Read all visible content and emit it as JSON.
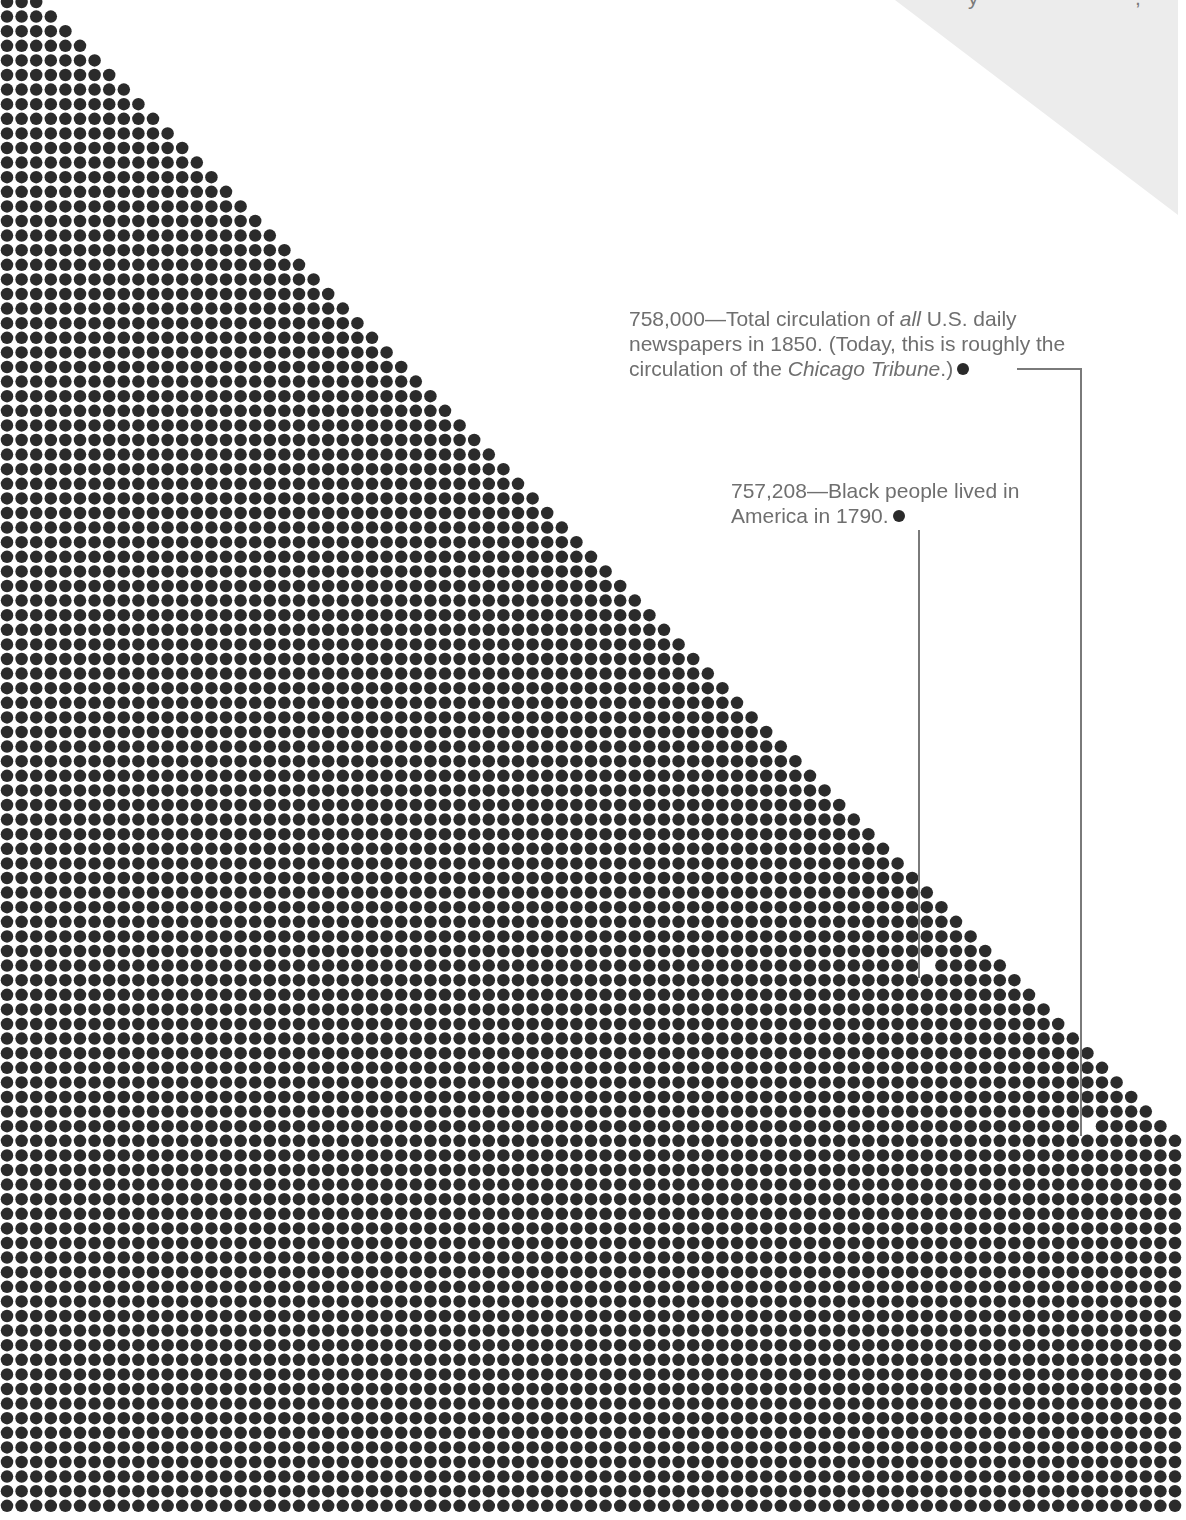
{
  "chart_data": {
    "type": "dot-matrix",
    "title": "",
    "layout": {
      "dot_pitch_px": 14.6,
      "dot_diameter_px": 12.5,
      "first_row_dots": 3,
      "dots_added_per_row": 1,
      "max_columns": 81,
      "rows_visible": 104,
      "dot_color": "#2b2b2b",
      "background": "#ffffff"
    },
    "annotations": [
      {
        "id": "newspapers-1850",
        "value": 758000,
        "value_label": "758,000",
        "text_parts": [
          {
            "t": "758,000—Total circulation of ",
            "italic": false
          },
          {
            "t": "all",
            "italic": true
          },
          {
            "t": " U.S. daily",
            "italic": false
          },
          {
            "br": true
          },
          {
            "t": "newspapers in 1850. (Today, this is roughly the",
            "italic": false
          },
          {
            "br": true
          },
          {
            "t": "circulation of the ",
            "italic": false
          },
          {
            "t": "Chicago Tribune",
            "italic": true
          },
          {
            "t": ".)",
            "italic": false
          }
        ],
        "marked_dot": {
          "row": 77,
          "col": 74
        }
      },
      {
        "id": "black-population-1790",
        "value": 757208,
        "value_label": "757,208",
        "text_parts": [
          {
            "t": "757,208—Black people lived in",
            "italic": false
          },
          {
            "br": true
          },
          {
            "t": "America in 1790.",
            "italic": false
          }
        ],
        "marked_dot": {
          "row": 66,
          "col": 63
        }
      }
    ],
    "background_shape": {
      "type": "gray-triangle",
      "color": "#ececec",
      "cropped_text_fragments": [
        "y",
        ","
      ]
    }
  }
}
